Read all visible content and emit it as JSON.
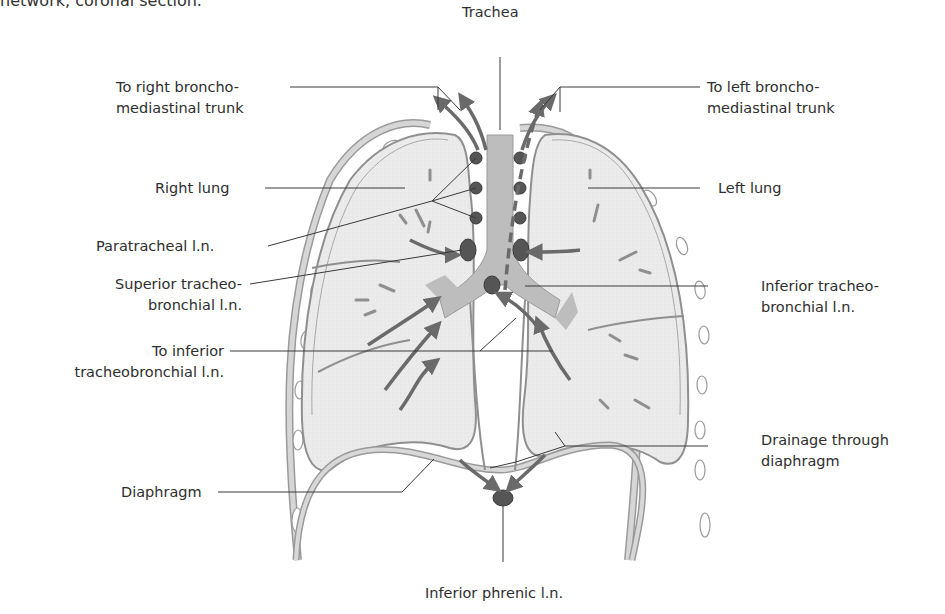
{
  "caption": "network, coronal section.",
  "labels": {
    "trachea": "Trachea",
    "to_right_trunk": [
      "To right broncho-",
      "mediastinal trunk"
    ],
    "to_left_trunk": [
      "To left broncho-",
      "mediastinal trunk"
    ],
    "right_lung": "Right lung",
    "left_lung": "Left lung",
    "paratracheal": "Paratracheal l.n.",
    "superior_tracheobronchial": [
      "Superior tracheo-",
      "bronchial l.n."
    ],
    "inferior_tracheobronchial": [
      "Inferior tracheo-",
      "bronchial l.n."
    ],
    "to_inferior_tracheobronchial": [
      "To inferior",
      "tracheobronchial l.n."
    ],
    "drainage_through_diaphragm": [
      "Drainage through",
      "diaphragm"
    ],
    "diaphragm": "Diaphragm",
    "inferior_phrenic": "Inferior phrenic l.n."
  },
  "colors": {
    "lung_fill": "#e9e9e9",
    "pleura": "#8f8f8f",
    "trachea_fill": "#bdbdbd",
    "node_fill": "#555555",
    "arrow": "#6a6a6a",
    "leader": "#3a3a3a"
  }
}
